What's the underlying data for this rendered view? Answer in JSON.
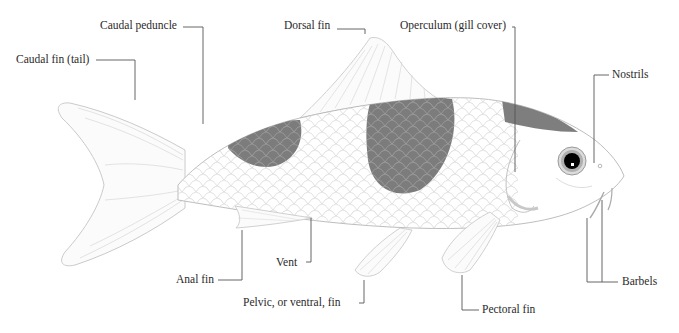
{
  "diagram": {
    "colors": {
      "background": "#ffffff",
      "outline": "#b8b8b8",
      "patch": "#7a7a7a",
      "leader": "#555555",
      "label_text": "#2a2a2a",
      "eye_iris": "#9a9a9a",
      "pupil": "#000000"
    },
    "labels": {
      "caudal_fin": "Caudal fin (tail)",
      "caudal_peduncle": "Caudal peduncle",
      "dorsal_fin": "Dorsal fin",
      "operculum": "Operculum (gill cover)",
      "nostrils": "Nostrils",
      "barbels": "Barbels",
      "pectoral_fin": "Pectoral fin",
      "pelvic_fin": "Pelvic, or ventral, fin",
      "vent": "Vent",
      "anal_fin": "Anal fin"
    }
  }
}
